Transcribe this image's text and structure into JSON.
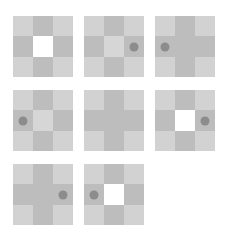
{
  "figure": {
    "colors": {
      "light": "#d2d2d2",
      "dark": "#bdbdbd",
      "center_light": "#d6d6d6",
      "white": "#ffffff",
      "dot": "#8c8c8c"
    },
    "panels": [
      {
        "index": 1,
        "center": "white",
        "dot": "none",
        "arms": "dark"
      },
      {
        "index": 2,
        "center": "center_light",
        "dot": "right",
        "arms": "dark"
      },
      {
        "index": 3,
        "center": "dark",
        "dot": "left",
        "arms": "dark"
      },
      {
        "index": 4,
        "center": "center_light",
        "dot": "left",
        "arms": "dark"
      },
      {
        "index": 5,
        "center": "dark",
        "dot": "none",
        "arms": "dark"
      },
      {
        "index": 6,
        "center": "white",
        "dot": "right",
        "arms": "dark"
      },
      {
        "index": 7,
        "center": "dark",
        "dot": "right",
        "arms": "dark"
      },
      {
        "index": 8,
        "center": "white",
        "dot": "left",
        "arms": "dark"
      }
    ]
  }
}
